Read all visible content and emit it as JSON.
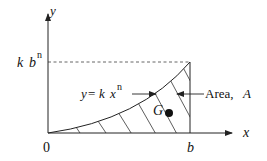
{
  "diagram": {
    "type": "area-under-curve",
    "axes": {
      "x_label": "x",
      "y_label": "y",
      "origin_label": "0"
    },
    "labels": {
      "y_tick": {
        "k": "k",
        "b": "b",
        "n": "n"
      },
      "x_tick": "b",
      "curve_equation": {
        "lhs": "y",
        "eq": "=",
        "k": "k",
        "x": "x",
        "n": "n"
      },
      "area": {
        "text": "Area,",
        "symbol": "A"
      },
      "centroid": "G"
    },
    "colors": {
      "line": "#222222",
      "dashed": "#555555",
      "background": "#ffffff"
    }
  }
}
